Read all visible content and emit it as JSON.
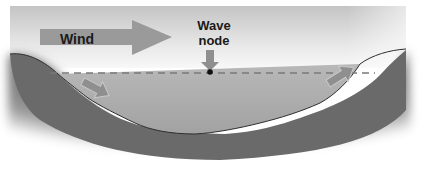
{
  "diagram": {
    "labels": {
      "wind": "Wind",
      "wave_node_line1": "Wave",
      "wave_node_line2": "node"
    },
    "elements": {
      "sky_panel": "gray gradient rectangle",
      "wind_arrow": "large gray arrow pointing right",
      "node_arrow": "gray arrow pointing down to node point",
      "water_surface_original": "dashed horizontal line",
      "water_surface_tilted": "tilted water surface, higher on right",
      "left_current_arrow": "arrow pointing down-right along left slope",
      "right_current_arrow": "arrow pointing up-right toward right shore",
      "basin": "dark gray lake basin with blurred edges"
    },
    "colors": {
      "sky_top": "#c8c8c8",
      "sky_bottom": "#f4f4f4",
      "water": "#a9a9a9",
      "basin": "#6e6e6e",
      "arrow": "#8f8f8f",
      "dashed_line": "#7a7a7a",
      "node_dot": "#111111",
      "text": "#1a1a1a"
    }
  }
}
